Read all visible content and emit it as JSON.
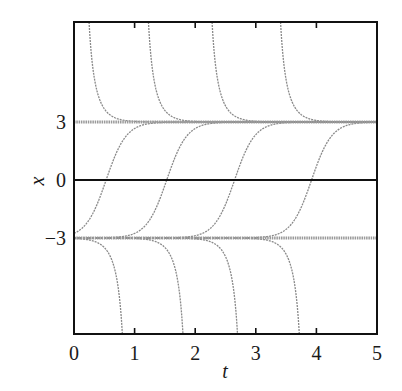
{
  "chart_data": {
    "type": "line",
    "title": "",
    "xlabel": "t",
    "ylabel": "x",
    "xlim": [
      0,
      5
    ],
    "ylim": [
      -8,
      8
    ],
    "grid": false,
    "legend": null,
    "x_ticks": [
      0,
      1,
      2,
      3,
      4,
      5
    ],
    "x_tick_labels": [
      "0",
      "1",
      "2",
      "3",
      "4",
      "5"
    ],
    "y_ticks": [
      3,
      0,
      -3
    ],
    "y_tick_labels": [
      "3",
      "0",
      "−3"
    ],
    "equilibria": [
      {
        "name": "stable-equilibrium",
        "x": 3,
        "style": "thick-gray"
      },
      {
        "name": "zero-line",
        "x": 0,
        "style": "solid-black"
      },
      {
        "name": "unstable-equilibrium",
        "x": -3,
        "style": "thick-gray"
      }
    ],
    "series": [
      {
        "name": "upper-decay",
        "model": "x = 3*coth(3*(t - t0)), t > t0",
        "t0": [
          0.12,
          1.1,
          2.15,
          3.28
        ],
        "description": "curves decaying from above toward x = 3"
      },
      {
        "name": "s-curves",
        "model": "x = 3*tanh(3*(t - t0))",
        "t0": [
          0.53,
          1.53,
          2.65,
          3.92
        ],
        "description": "curves rising from x = -3 to x = 3, crossing 0 at t0"
      },
      {
        "name": "lower-blowup",
        "model": "x = 3*coth(3*(t - t0)), t < t0",
        "t0": [
          0.93,
          1.93,
          2.83,
          3.85
        ],
        "description": "curves leaving x = -3 and diverging downward"
      }
    ]
  },
  "colors": {
    "frame": "#111111",
    "curve": "#8a8a8a",
    "equilibrium": "#9a9a9a",
    "zero_line": "#111111"
  }
}
